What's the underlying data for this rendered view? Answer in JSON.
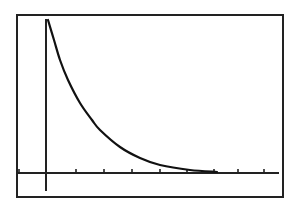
{
  "chart_data": {
    "type": "line",
    "title": "",
    "xlabel": "",
    "ylabel": "",
    "grid": false,
    "legend": null,
    "x_ticks_count_positive": 8,
    "x_ticks_count_negative": 1,
    "series": [
      {
        "name": "y = a·e^(-kx)",
        "approx_points_px": [
          [
            48,
            20
          ],
          [
            54,
            40
          ],
          [
            60,
            60
          ],
          [
            68,
            80
          ],
          [
            80,
            103
          ],
          [
            92,
            120
          ],
          [
            100,
            130
          ],
          [
            120,
            147
          ],
          [
            140,
            158
          ],
          [
            160,
            165
          ],
          [
            190,
            170
          ],
          [
            217,
            172
          ]
        ]
      }
    ],
    "colors": {
      "frame": "#222222",
      "axes": "#222222",
      "curve": "#111111",
      "background": "#ffffff"
    }
  },
  "window": {
    "frame": {
      "left": 17,
      "top": 15,
      "right": 283,
      "bottom": 197
    },
    "origin_px": {
      "x": 46,
      "y": 173
    },
    "tick_px_x": [
      19,
      76,
      104,
      132,
      160,
      187,
      214,
      238,
      264
    ]
  }
}
